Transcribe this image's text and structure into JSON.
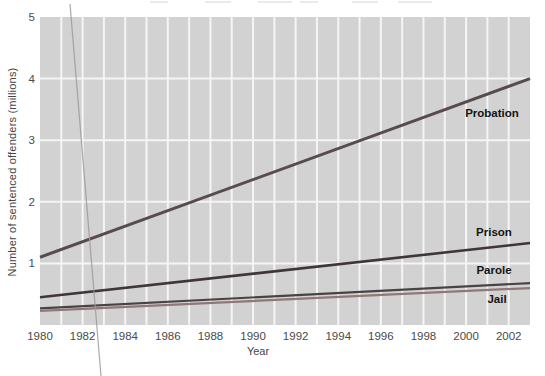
{
  "chart_data": {
    "type": "line",
    "title": "",
    "xlabel": "Year",
    "ylabel": "Number of sentenced offenders (millions)",
    "x_range": [
      1980,
      2003
    ],
    "x_ticks": [
      1980,
      1982,
      1984,
      1986,
      1988,
      1990,
      1992,
      1994,
      1996,
      1998,
      2000,
      2002
    ],
    "ylim": [
      0,
      5
    ],
    "y_ticks": [
      1,
      2,
      3,
      4,
      5
    ],
    "grid": {
      "on": true,
      "plot_bg": "#d2d2d2",
      "gridline_color": "#f5f5f5",
      "vertical_gridline_every_years": 1
    },
    "legend": "inline bold labels beside lines",
    "axis_text_color": "#4a4a4a",
    "label_text_color": "#141414",
    "series": [
      {
        "name": "Probation",
        "color": "#584b4f",
        "width": 3.0,
        "x": [
          1980,
          2003
        ],
        "values": [
          1.1,
          4.0
        ],
        "label_px": [
          492,
          113
        ]
      },
      {
        "name": "Prison",
        "color": "#3e3639",
        "width": 2.6,
        "x": [
          1980,
          2003
        ],
        "values": [
          0.45,
          1.33
        ],
        "label_px": [
          494,
          232
        ]
      },
      {
        "name": "Parole",
        "color": "#4a4245",
        "width": 2.2,
        "x": [
          1980,
          2003
        ],
        "values": [
          0.27,
          0.68
        ],
        "label_px": [
          494,
          270
        ]
      },
      {
        "name": "Jail",
        "color": "#8f7878",
        "width": 2.2,
        "x": [
          1980,
          2003
        ],
        "values": [
          0.23,
          0.6
        ],
        "label_px": [
          497,
          299
        ]
      }
    ]
  },
  "artifacts": {
    "stray_scan_line": {
      "from_px": [
        70,
        4
      ],
      "to_px": [
        101,
        376
      ],
      "color": "#a09a98"
    }
  }
}
